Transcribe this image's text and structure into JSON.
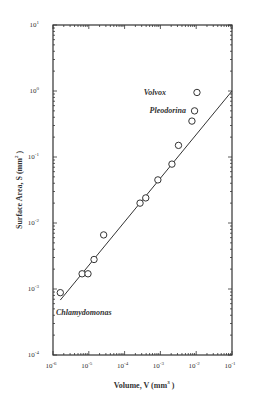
{
  "chart_data": {
    "type": "scatter",
    "title": "",
    "xlabel": "Volume, V (mm³)",
    "ylabel": "Surface Area, S (mm²)",
    "xscale": "log",
    "yscale": "log",
    "xlim": [
      1e-06,
      0.1
    ],
    "ylim": [
      0.0001,
      10
    ],
    "x_ticks": [
      "10⁻⁶",
      "10⁻⁵",
      "10⁻⁴",
      "10⁻³",
      "10⁻²",
      "10⁻¹"
    ],
    "y_ticks": [
      "10⁻⁴",
      "10⁻³",
      "10⁻²",
      "10⁻¹",
      "10⁰",
      "10¹"
    ],
    "grid": false,
    "legend": null,
    "series": [
      {
        "name": "Volvocine algae",
        "marker": "open-circle",
        "points": [
          {
            "x": 1.6e-06,
            "y": 0.00088,
            "label": "Chlamydomonas"
          },
          {
            "x": 6.5e-06,
            "y": 0.0017
          },
          {
            "x": 9.5e-06,
            "y": 0.0017
          },
          {
            "x": 1.4e-05,
            "y": 0.0028
          },
          {
            "x": 2.6e-05,
            "y": 0.0066
          },
          {
            "x": 0.00027,
            "y": 0.02
          },
          {
            "x": 0.00039,
            "y": 0.024
          },
          {
            "x": 0.00085,
            "y": 0.045
          },
          {
            "x": 0.0021,
            "y": 0.078
          },
          {
            "x": 0.0032,
            "y": 0.15
          },
          {
            "x": 0.0076,
            "y": 0.35
          },
          {
            "x": 0.009,
            "y": 0.5,
            "label": "Pleodorina"
          },
          {
            "x": 0.0105,
            "y": 0.95,
            "label": "Volvox"
          }
        ]
      },
      {
        "name": "Fit line",
        "type": "line",
        "points": [
          {
            "x": 1.6e-06,
            "y": 0.00068
          },
          {
            "x": 0.1,
            "y": 1.0
          }
        ]
      }
    ],
    "annotations": [
      {
        "text": "Volvox",
        "x": 0.0105,
        "y": 0.95
      },
      {
        "text": "Pleodorina",
        "x": 0.009,
        "y": 0.5
      },
      {
        "text": "Chlamydomonas",
        "x": 1.6e-06,
        "y": 0.0003
      }
    ]
  },
  "labels": {
    "xlabel_main": "Volume, V (mm",
    "xlabel_sup": "3",
    "xlabel_end": " )",
    "ylabel_main": "Surface Area, S (mm",
    "ylabel_sup": "2",
    "ylabel_end": " )",
    "annot_volvox": "Volvox",
    "annot_pleodorina": "Pleodorina",
    "annot_chlamydomonas": "Chlamydomonas",
    "x_tick_base": "10",
    "x_tick_exps": [
      "-6",
      "-5",
      "-4",
      "-3",
      "-2",
      "-1"
    ],
    "y_tick_base": "10",
    "y_tick_exps": [
      "1",
      "0",
      "-1",
      "-2",
      "-3",
      "-4"
    ]
  }
}
